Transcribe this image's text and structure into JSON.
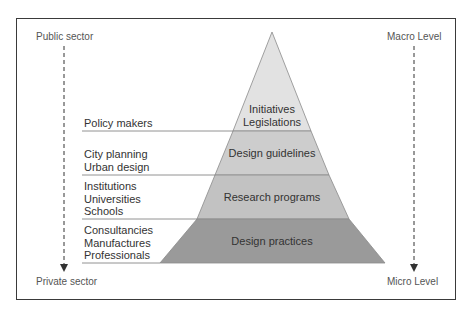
{
  "diagram": {
    "type": "pyramid",
    "left_axis": {
      "top_label": "Public sector",
      "bottom_label": "Private sector"
    },
    "right_axis": {
      "top_label": "Macro Level",
      "bottom_label": "Micro Level"
    },
    "tiers": [
      {
        "label": "Initiatives\nLegislations",
        "actors": "Policy makers",
        "color": "#e2e2e2"
      },
      {
        "label": "Design guidelines",
        "actors": "City planning\nUrban design",
        "color": "#cdcdcd"
      },
      {
        "label": "Research programs",
        "actors": "Institutions\nUniversities\nSchools",
        "color": "#c2c2c2"
      },
      {
        "label": "Design practices",
        "actors": "Consultancies\nManufactures\nProfessionals",
        "color": "#9a9a9a"
      }
    ]
  }
}
